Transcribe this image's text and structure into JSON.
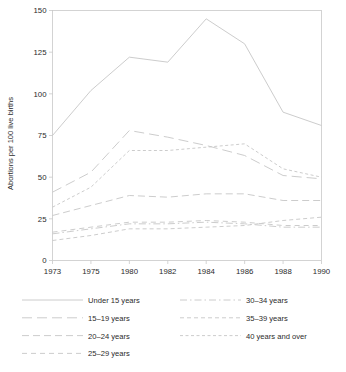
{
  "chart_data": {
    "type": "line",
    "title": "",
    "subtitle": "",
    "xlabel": "",
    "ylabel": "Abortions per 100 live births",
    "x": [
      1973,
      1975,
      1980,
      1982,
      1984,
      1986,
      1988,
      1990
    ],
    "xtick_labels": [
      "1973",
      "1975",
      "1980",
      "1982",
      "1984",
      "1986",
      "1988",
      "1990"
    ],
    "ytick_labels": [
      "0",
      "25",
      "50",
      "75",
      "100",
      "125",
      "150"
    ],
    "yticks": [
      0,
      25,
      50,
      75,
      100,
      125,
      150
    ],
    "ylim": [
      0,
      150
    ],
    "grid": false,
    "legend_position": "below",
    "legend_columns": 2,
    "axis_note": "x tick positions are evenly spaced by tick index, not by year value",
    "series": [
      {
        "name": "Under 15 years",
        "dash": "solid",
        "values": [
          75,
          102,
          122,
          119,
          145,
          130,
          89,
          81
        ]
      },
      {
        "name": "15–19 years",
        "dash": "long-dash",
        "values": [
          41,
          53,
          78,
          74,
          69,
          63,
          51,
          49
        ]
      },
      {
        "name": "20–24 years",
        "dash": "medium-dash",
        "values": [
          27,
          33,
          39,
          38,
          40,
          40,
          36,
          36
        ]
      },
      {
        "name": "25–29 years",
        "dash": "dash",
        "values": [
          17,
          20,
          23,
          23,
          24,
          23,
          21,
          21
        ]
      },
      {
        "name": "30–34 years",
        "dash": "dash-dot",
        "values": [
          16,
          19,
          22,
          22,
          23,
          22,
          20,
          20
        ]
      },
      {
        "name": "35–39 years",
        "dash": "short-dash",
        "values": [
          12,
          15,
          19,
          19,
          20,
          21,
          24,
          26
        ]
      },
      {
        "name": "40 years and over",
        "dash": "fine-dash",
        "values": [
          32,
          44,
          66,
          66,
          68,
          70,
          55,
          50
        ]
      }
    ]
  },
  "legend": {
    "entries": [
      {
        "label": "Under 15 years",
        "dash": "solid"
      },
      {
        "label": "15–19 years",
        "dash": "long-dash"
      },
      {
        "label": "20–24 years",
        "dash": "medium-dash"
      },
      {
        "label": "25–29 years",
        "dash": "dash"
      },
      {
        "label": "30–34 years",
        "dash": "dash-dot"
      },
      {
        "label": "35–39 years",
        "dash": "short-dash"
      },
      {
        "label": "40 years and over",
        "dash": "fine-dash"
      }
    ]
  },
  "colors": {
    "line": "#c6c6c6",
    "axis": "#c9c9c9",
    "text": "#2b2b2b",
    "background": "#ffffff"
  }
}
